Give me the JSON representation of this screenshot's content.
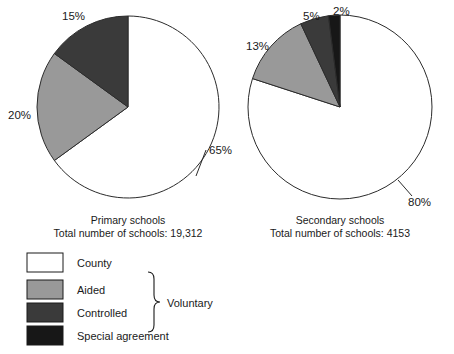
{
  "chart_data": [
    {
      "type": "pie",
      "title": "Primary schools",
      "subtitle": "Total number of schools: 19,312",
      "total": 19312,
      "total_label": "19,312",
      "categories": [
        "County",
        "Aided",
        "Controlled",
        "Special agreement"
      ],
      "values": [
        65,
        20,
        15,
        0
      ],
      "value_labels": [
        "65%",
        "20%",
        "15%",
        ""
      ],
      "colors": [
        "#ffffff",
        "#999999",
        "#3a3a3a",
        "#171717"
      ],
      "start_angle_deg": 0,
      "direction": "clockwise",
      "center": {
        "x": 128,
        "y": 107
      },
      "radius": 91,
      "legend_position": "bottom-left"
    },
    {
      "type": "pie",
      "title": "Secondary schools",
      "subtitle": "Total number of schools: 4153",
      "total": 4153,
      "total_label": "4153",
      "categories": [
        "County",
        "Aided",
        "Controlled",
        "Special agreement"
      ],
      "values": [
        80,
        13,
        5,
        2
      ],
      "value_labels": [
        "80%",
        "13%",
        "5%",
        "2%"
      ],
      "colors": [
        "#ffffff",
        "#999999",
        "#3a3a3a",
        "#171717"
      ],
      "start_angle_deg": 0,
      "direction": "clockwise",
      "center": {
        "x": 340,
        "y": 107
      },
      "radius": 92,
      "legend_position": "bottom-left"
    }
  ],
  "pies": [
    {
      "id": "primary",
      "center": {
        "x": 128,
        "y": 107
      },
      "radius": 91,
      "slices": [
        {
          "name": "County",
          "percent": 65,
          "color": "#ffffff",
          "label": "65%",
          "label_x": 209,
          "label_y": 154
        },
        {
          "name": "Aided",
          "percent": 20,
          "color": "#999999",
          "label": "20%",
          "label_x": 8,
          "label_y": 119
        },
        {
          "name": "Controlled",
          "percent": 15,
          "color": "#3a3a3a",
          "label": "15%",
          "label_x": 62,
          "label_y": 20
        },
        {
          "name": "Special agreement",
          "percent": 0,
          "color": "#171717",
          "label": "",
          "label_x": 0,
          "label_y": 0
        }
      ],
      "caption_line1": "Primary schools",
      "caption_line2": "Total number of schools: 19,312",
      "caption_x": 128,
      "caption_y": 224
    },
    {
      "id": "secondary",
      "center": {
        "x": 340,
        "y": 107
      },
      "radius": 92,
      "slices": [
        {
          "name": "County",
          "percent": 80,
          "color": "#ffffff",
          "label": "80%",
          "label_x": 408,
          "label_y": 206
        },
        {
          "name": "Aided",
          "percent": 13,
          "color": "#999999",
          "label": "13%",
          "label_x": 246,
          "label_y": 50
        },
        {
          "name": "Controlled",
          "percent": 5,
          "color": "#3a3a3a",
          "label": "5%",
          "label_x": 303,
          "label_y": 20
        },
        {
          "name": "Special agreement",
          "percent": 2,
          "color": "#171717",
          "label": "2%",
          "label_x": 333,
          "label_y": 15
        }
      ],
      "caption_line1": "Secondary schools",
      "caption_line2": "Total number of schools: 4153",
      "caption_x": 340,
      "caption_y": 224
    }
  ],
  "legend": {
    "items": [
      {
        "label": "County",
        "color": "#ffffff"
      },
      {
        "label": "Aided",
        "color": "#999999"
      },
      {
        "label": "Controlled",
        "color": "#3a3a3a"
      },
      {
        "label": "Special agreement",
        "color": "#171717"
      }
    ],
    "group_label": "Voluntary",
    "group_members": [
      "Aided",
      "Controlled",
      "Special agreement"
    ]
  }
}
